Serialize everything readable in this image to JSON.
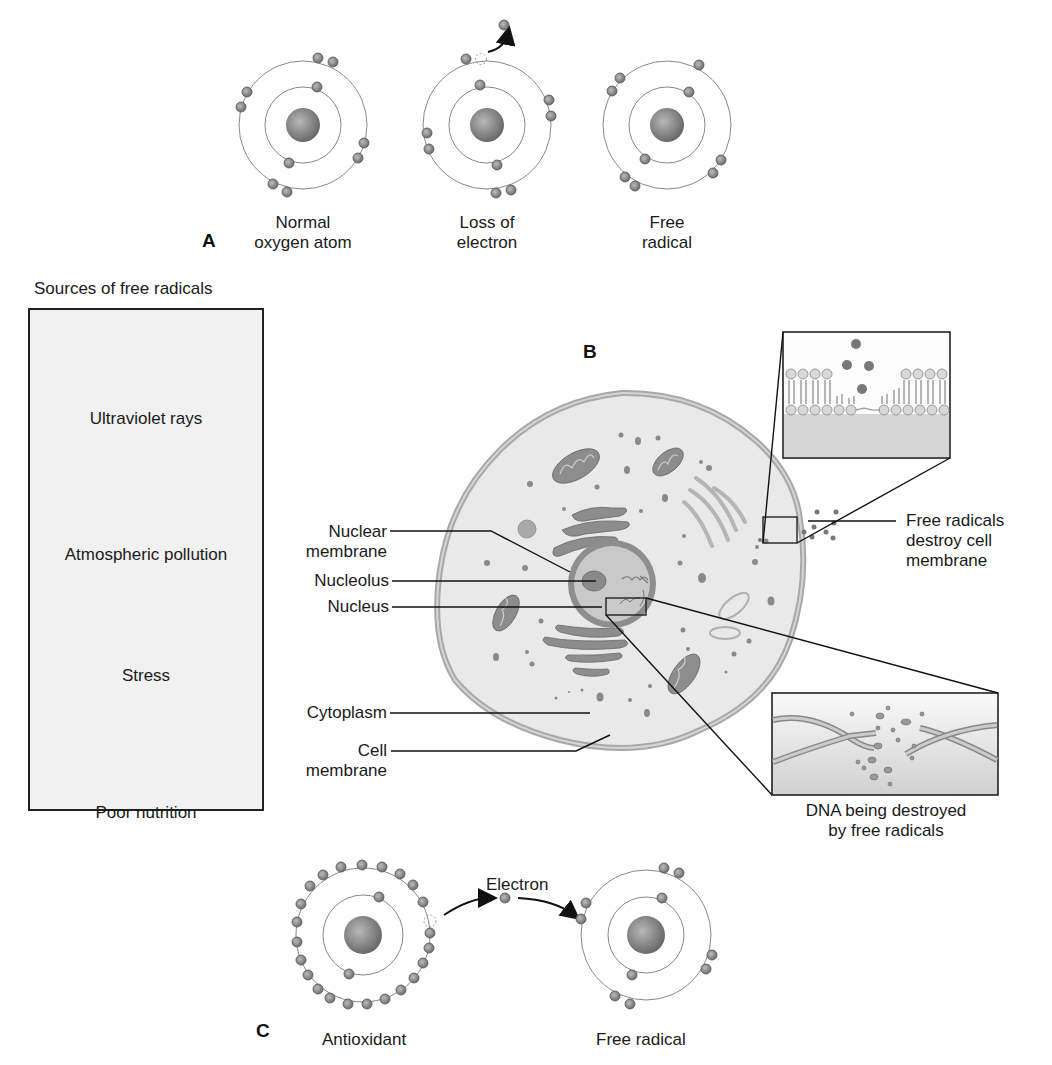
{
  "panel_a": {
    "letter": "A",
    "atoms": [
      {
        "label_line1": "Normal",
        "label_line2": "oxygen atom"
      },
      {
        "label_line1": "Loss of",
        "label_line2": "electron"
      },
      {
        "label_line1": "Free",
        "label_line2": "radical"
      }
    ]
  },
  "sources": {
    "title": "Sources of free radicals",
    "items": [
      {
        "label": "Ultraviolet rays",
        "icon": "sun-icon"
      },
      {
        "label": "Atmospheric pollution",
        "icon": "factory-icon"
      },
      {
        "label": "Stress",
        "icon": "stressed-person-icon"
      },
      {
        "label": "Poor nutrition",
        "icon": "junk-food-icon"
      }
    ]
  },
  "panel_b": {
    "letter": "B",
    "labels": {
      "nuclear_membrane_1": "Nuclear",
      "nuclear_membrane_2": "membrane",
      "nucleolus": "Nucleolus",
      "nucleus": "Nucleus",
      "cytoplasm": "Cytoplasm",
      "cell_membrane_1": "Cell",
      "cell_membrane_2": "membrane",
      "free_radicals_1": "Free radicals",
      "free_radicals_2": "destroy cell",
      "free_radicals_3": "membrane",
      "dna_1": "DNA being destroyed",
      "dna_2": "by free radicals"
    }
  },
  "panel_c": {
    "letter": "C",
    "antioxidant": "Antioxidant",
    "electron": "Electron",
    "free_radical": "Free radical"
  },
  "colors": {
    "electron": "#8a8a8a",
    "nucleus": "#7d7d7d",
    "orbit": "#777777",
    "cell_fill": "#e6e6e6",
    "organelle": "#8c8c8c",
    "box_fill": "#f1f1f1"
  }
}
